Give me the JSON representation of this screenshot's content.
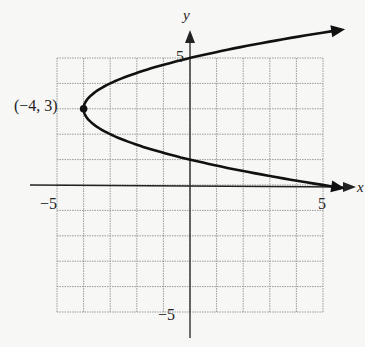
{
  "chart_data": {
    "type": "line",
    "title": "",
    "xlabel": "x",
    "ylabel": "y",
    "xlim": [
      -5,
      5
    ],
    "ylim": [
      -5,
      5
    ],
    "grid": true,
    "grid_step": 1,
    "tick_labels": {
      "x": [
        {
          "value": -5,
          "label": "−5"
        },
        {
          "value": 5,
          "label": "5"
        }
      ],
      "y": [
        {
          "value": 5,
          "label": "5"
        },
        {
          "value": -5,
          "label": "−5"
        }
      ]
    },
    "series": [
      {
        "name": "parabola",
        "equation": "x = (y − 3)^2 − 4",
        "points": [
          {
            "x": 5.4,
            "y": 6.1
          },
          {
            "x": 0,
            "y": 5
          },
          {
            "x": -3,
            "y": 4
          },
          {
            "x": -4,
            "y": 3
          },
          {
            "x": -3,
            "y": 2
          },
          {
            "x": 0,
            "y": 1
          },
          {
            "x": 5,
            "y": 0
          },
          {
            "x": 6.1,
            "y": -0.1
          }
        ],
        "arrows": "both-ends"
      }
    ],
    "annotations": [
      {
        "x": -4,
        "y": 3,
        "label": "(−4, 3)",
        "marker": "filled-circle"
      }
    ]
  }
}
